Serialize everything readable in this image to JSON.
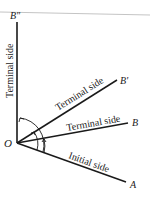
{
  "diagram": {
    "origin_label": "O",
    "initial_side": {
      "label": "Initial side",
      "endpoint": "A"
    },
    "terminal_sides": [
      {
        "label": "Terminal side",
        "endpoint": "B"
      },
      {
        "label": "Terminal side",
        "endpoint": "B'"
      },
      {
        "label": "Terminal side",
        "endpoint": "B\""
      }
    ],
    "colors": {
      "ink": "#1a1a1a",
      "rule": "#bdbdbd"
    }
  }
}
